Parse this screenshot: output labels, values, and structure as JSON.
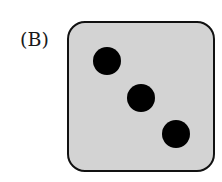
{
  "label": "(B)",
  "die": {
    "face_value": 3,
    "face_color": "#d3d3d3",
    "border_color": "#111111",
    "pip_color": "#000000",
    "pips": [
      {
        "position": "top-left"
      },
      {
        "position": "center"
      },
      {
        "position": "bottom-right"
      }
    ]
  }
}
